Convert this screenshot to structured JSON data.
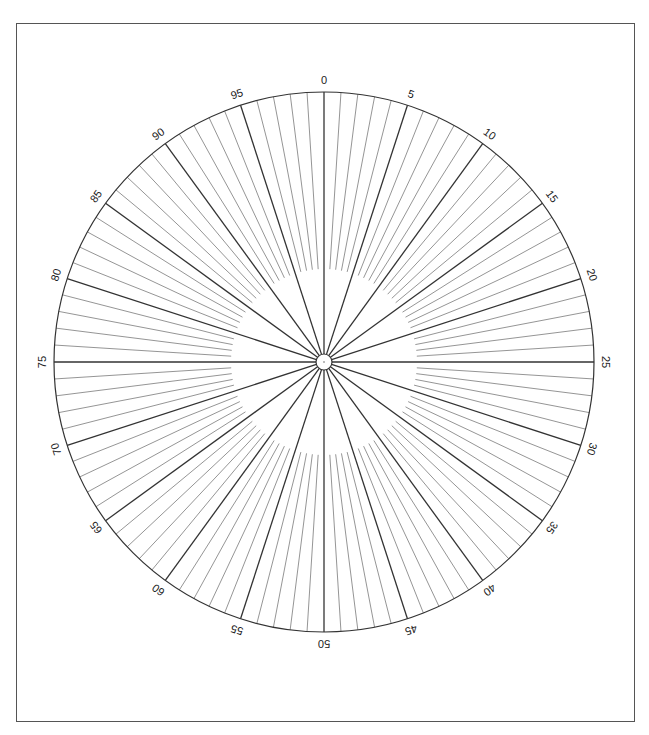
{
  "diagram": {
    "type": "polar-percentage-dial",
    "divisions": 100,
    "major_every": 5,
    "labels": [
      "0",
      "5",
      "10",
      "15",
      "20",
      "25",
      "30",
      "35",
      "40",
      "45",
      "50",
      "55",
      "60",
      "65",
      "70",
      "75",
      "80",
      "85",
      "90",
      "95"
    ],
    "center": {
      "x": 324,
      "y": 362
    },
    "outer_radius": 270,
    "inner_ring_radius": 93,
    "hub_radius": 8,
    "label_radius": 282,
    "colors": {
      "major_line": "#333333",
      "minor_line": "#7a7a7a",
      "outline": "#333333",
      "frame": "#555555"
    }
  }
}
